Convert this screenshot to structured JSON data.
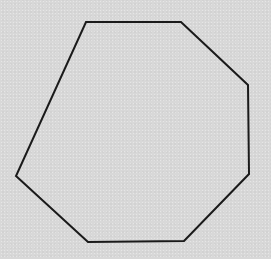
{
  "figure": {
    "shape": "heptagon",
    "vertex_count": 7,
    "vertices": [
      [
        86,
        22
      ],
      [
        181,
        22
      ],
      [
        248,
        85
      ],
      [
        249,
        174
      ],
      [
        184,
        241
      ],
      [
        88,
        242
      ],
      [
        16,
        176
      ]
    ],
    "stroke_color": "#1a1a1a",
    "stroke_width": 2,
    "fill": "none",
    "background_color": "#d8d8d8"
  }
}
